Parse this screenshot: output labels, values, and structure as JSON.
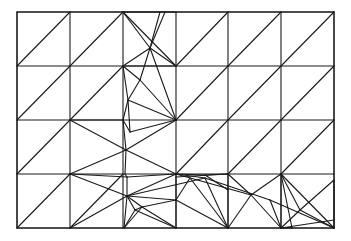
{
  "diagram": {
    "type": "triangular-mesh",
    "width": 351,
    "height": 241,
    "stroke_color": "#1a1a1a",
    "bounds": {
      "x0": 17,
      "y0": 12,
      "x1": 334,
      "y1": 228
    },
    "grid_x": [
      17,
      70,
      123,
      176,
      228,
      281,
      334
    ],
    "grid_y": [
      12,
      66,
      120,
      174,
      228
    ],
    "edges": [
      [
        17,
        66,
        70,
        12
      ],
      [
        70,
        66,
        123,
        12
      ],
      [
        176,
        66,
        228,
        12
      ],
      [
        228,
        66,
        281,
        12
      ],
      [
        281,
        66,
        334,
        12
      ],
      [
        17,
        120,
        70,
        66
      ],
      [
        70,
        120,
        123,
        66
      ],
      [
        176,
        120,
        228,
        66
      ],
      [
        228,
        120,
        281,
        66
      ],
      [
        281,
        120,
        334,
        66
      ],
      [
        176,
        174,
        228,
        120
      ],
      [
        228,
        174,
        281,
        120
      ],
      [
        281,
        174,
        334,
        120
      ],
      [
        17,
        174,
        70,
        120
      ],
      [
        17,
        228,
        70,
        174
      ],
      [
        70,
        228,
        123,
        174
      ],
      [
        123,
        12,
        165,
        12
      ],
      [
        165,
        12,
        176,
        12
      ],
      [
        123,
        12,
        150,
        48
      ],
      [
        123,
        12,
        176,
        66
      ],
      [
        150,
        48,
        176,
        66
      ],
      [
        165,
        12,
        150,
        48
      ],
      [
        160,
        12,
        150,
        48
      ],
      [
        150,
        48,
        140,
        80
      ],
      [
        123,
        66,
        150,
        48
      ],
      [
        123,
        66,
        176,
        66
      ],
      [
        123,
        66,
        140,
        80
      ],
      [
        140,
        80,
        176,
        120
      ],
      [
        140,
        80,
        128,
        100
      ],
      [
        123,
        66,
        128,
        100
      ],
      [
        150,
        48,
        176,
        120
      ],
      [
        128,
        100,
        176,
        120
      ],
      [
        128,
        100,
        123,
        120
      ],
      [
        128,
        100,
        130,
        132
      ],
      [
        123,
        120,
        130,
        132
      ],
      [
        130,
        132,
        176,
        120
      ],
      [
        70,
        120,
        123,
        120
      ],
      [
        70,
        120,
        126,
        150
      ],
      [
        70,
        174,
        126,
        150
      ],
      [
        123,
        120,
        126,
        150
      ],
      [
        126,
        150,
        176,
        174
      ],
      [
        126,
        150,
        176,
        120
      ],
      [
        126,
        150,
        125,
        174
      ],
      [
        70,
        174,
        127,
        177
      ],
      [
        127,
        177,
        176,
        174
      ],
      [
        127,
        177,
        125,
        174
      ],
      [
        70,
        174,
        127,
        196
      ],
      [
        127,
        196,
        176,
        174
      ],
      [
        127,
        177,
        127,
        196
      ],
      [
        127,
        196,
        124,
        228
      ],
      [
        70,
        228,
        127,
        196
      ],
      [
        127,
        196,
        135,
        210
      ],
      [
        127,
        196,
        142,
        207
      ],
      [
        135,
        210,
        124,
        228
      ],
      [
        142,
        207,
        124,
        228
      ],
      [
        135,
        210,
        176,
        228
      ],
      [
        142,
        207,
        176,
        228
      ],
      [
        135,
        210,
        142,
        207
      ],
      [
        142,
        207,
        176,
        200
      ],
      [
        176,
        200,
        176,
        228
      ],
      [
        127,
        196,
        176,
        200
      ],
      [
        176,
        174,
        176,
        200
      ],
      [
        176,
        174,
        205,
        178
      ],
      [
        127,
        196,
        205,
        178
      ],
      [
        176,
        174,
        205,
        175
      ],
      [
        176,
        177,
        228,
        174
      ],
      [
        205,
        175,
        228,
        174
      ],
      [
        190,
        178,
        176,
        200
      ],
      [
        176,
        200,
        228,
        228
      ],
      [
        190,
        178,
        228,
        228
      ],
      [
        205,
        178,
        228,
        228
      ],
      [
        228,
        174,
        228,
        228
      ],
      [
        228,
        174,
        251,
        195
      ],
      [
        176,
        174,
        251,
        195
      ],
      [
        251,
        195,
        228,
        228
      ],
      [
        251,
        195,
        281,
        174
      ],
      [
        251,
        195,
        281,
        228
      ],
      [
        205,
        178,
        270,
        200
      ],
      [
        270,
        200,
        281,
        228
      ],
      [
        270,
        200,
        334,
        228
      ],
      [
        281,
        174,
        334,
        228
      ],
      [
        281,
        174,
        292,
        228
      ],
      [
        281,
        174,
        281,
        228
      ],
      [
        292,
        228,
        281,
        228
      ],
      [
        281,
        228,
        300,
        210
      ],
      [
        300,
        210,
        334,
        180
      ],
      [
        300,
        210,
        334,
        228
      ],
      [
        281,
        174,
        300,
        210
      ],
      [
        334,
        180,
        334,
        228
      ],
      [
        281,
        228,
        334,
        220
      ],
      [
        205,
        175,
        228,
        190
      ]
    ]
  }
}
